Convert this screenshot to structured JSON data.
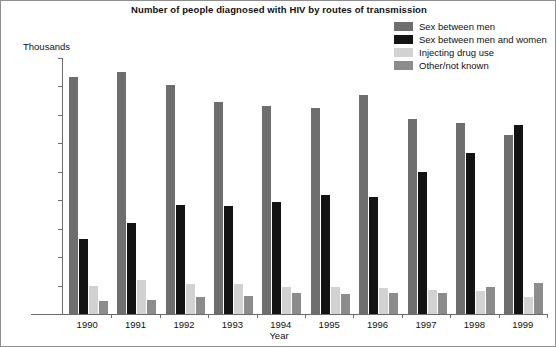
{
  "chart_data": {
    "type": "bar",
    "title": "Number of people diagnosed with HIV by routes of transmission",
    "xlabel": "Year",
    "ylabel": "Thousands",
    "ylim": [
      0,
      1.8
    ],
    "ytick_labels": [
      "0.000",
      "0.200",
      "0.400",
      "0.600",
      "0.800",
      "1.000",
      "1.200",
      "1.400",
      "1.600",
      "1.800"
    ],
    "ytick_values": [
      0,
      0.2,
      0.4,
      0.6,
      0.8,
      1.0,
      1.2,
      1.4,
      1.6,
      1.8
    ],
    "grid": false,
    "legend_position": "top-right",
    "categories": [
      "1990",
      "1991",
      "1992",
      "1993",
      "1994",
      "1995",
      "1996",
      "1997",
      "1998",
      "1999"
    ],
    "series": [
      {
        "name": "Sex between men",
        "color": "#6e6e6e",
        "values": [
          1.67,
          1.7,
          1.61,
          1.49,
          1.46,
          1.45,
          1.54,
          1.37,
          1.34,
          1.26
        ]
      },
      {
        "name": "Sex between men and women",
        "color": "#131313",
        "values": [
          0.53,
          0.64,
          0.77,
          0.76,
          0.79,
          0.84,
          0.82,
          1.0,
          1.13,
          1.33
        ]
      },
      {
        "name": "Injecting drug use",
        "color": "#d2d2d2",
        "values": [
          0.2,
          0.24,
          0.21,
          0.21,
          0.19,
          0.19,
          0.18,
          0.17,
          0.16,
          0.12
        ]
      },
      {
        "name": "Other/not known",
        "color": "#8c8c8c",
        "values": [
          0.09,
          0.1,
          0.12,
          0.13,
          0.15,
          0.14,
          0.15,
          0.15,
          0.19,
          0.22
        ]
      }
    ]
  }
}
